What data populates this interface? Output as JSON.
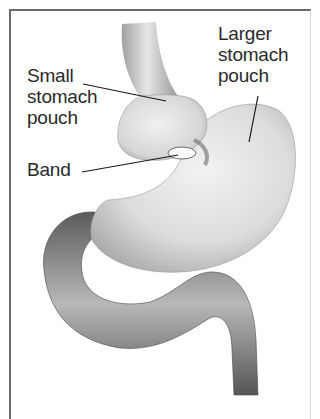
{
  "diagram": {
    "type": "anatomical illustration",
    "labels": {
      "small_pouch": "Small\nstomach\npouch",
      "band": "Band",
      "larger_pouch": "Larger\nstomach\npouch"
    },
    "colors": {
      "frame": "#6a6a6a",
      "organ_light": "#e8e8e8",
      "organ_mid": "#b0b0b0",
      "intestine_dark": "#6e6e6e",
      "text": "#2a2a2a",
      "leader_line": "#1a1a1a"
    }
  }
}
